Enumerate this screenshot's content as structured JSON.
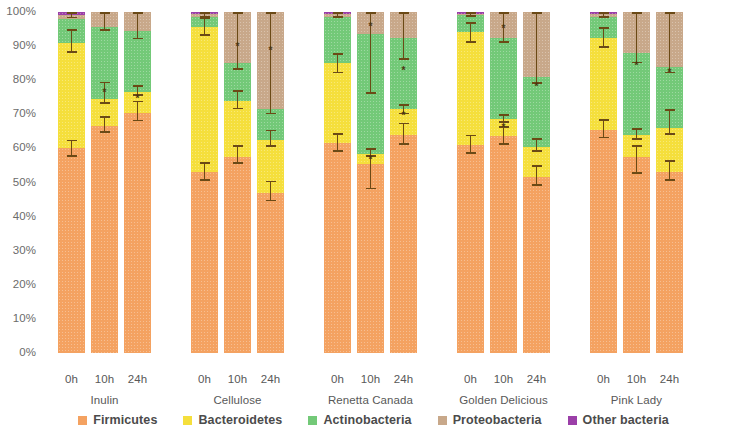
{
  "axis": {
    "y_ticks": [
      "100%",
      "90%",
      "80%",
      "70%",
      "60%",
      "50%",
      "40%",
      "30%",
      "20%",
      "10%",
      "0%"
    ],
    "y_min": 0,
    "y_max": 100
  },
  "legend": [
    {
      "label": "Firmicutes",
      "color": "#F4A261"
    },
    {
      "label": "Bacteroidetes",
      "color": "#F5DF3C"
    },
    {
      "label": "Actinobacteria",
      "color": "#73C978"
    },
    {
      "label": "Proteobacteria",
      "color": "#C8A88A"
    },
    {
      "label": "Other bacteria",
      "color": "#9B3FA8"
    }
  ],
  "groups": [
    {
      "name": "Inulin",
      "times": [
        "0h",
        "10h",
        "24h"
      ]
    },
    {
      "name": "Cellulose",
      "times": [
        "0h",
        "10h",
        "24h"
      ]
    },
    {
      "name": "Renetta Canada",
      "times": [
        "0h",
        "10h",
        "24h"
      ]
    },
    {
      "name": "Golden Delicious",
      "times": [
        "0h",
        "10h",
        "24h"
      ]
    },
    {
      "name": "Pink Lady",
      "times": [
        "0h",
        "10h",
        "24h"
      ]
    }
  ],
  "chart_data": {
    "type": "bar",
    "title": "",
    "xlabel": "",
    "ylabel": "",
    "ylim": [
      0,
      100
    ],
    "grid": false,
    "stacked": true,
    "legend_position": "bottom",
    "categories": [
      "Inulin 0h",
      "Inulin 10h",
      "Inulin 24h",
      "Cellulose 0h",
      "Cellulose 10h",
      "Cellulose 24h",
      "Renetta Canada 0h",
      "Renetta Canada 10h",
      "Renetta Canada 24h",
      "Golden Delicious 0h",
      "Golden Delicious 10h",
      "Golden Delicious 24h",
      "Pink Lady 0h",
      "Pink Lady 10h",
      "Pink Lady 24h"
    ],
    "series": [
      {
        "name": "Firmicutes",
        "color": "#F4A261",
        "values": [
          60.0,
          66.5,
          70.5,
          53.0,
          57.5,
          47.0,
          61.5,
          55.5,
          64.0,
          61.0,
          63.5,
          51.5,
          65.5,
          57.5,
          53.0
        ]
      },
      {
        "name": "Bacteroidetes",
        "color": "#F5DF3C",
        "values": [
          31.0,
          8.0,
          6.0,
          42.5,
          16.5,
          15.5,
          23.5,
          3.0,
          7.5,
          33.0,
          5.0,
          9.0,
          27.0,
          6.5,
          13.0
        ]
      },
      {
        "name": "Actinobacteria",
        "color": "#73C978",
        "values": [
          7.0,
          21.0,
          18.0,
          3.0,
          11.0,
          9.0,
          13.5,
          35.0,
          21.0,
          5.0,
          24.0,
          20.5,
          6.0,
          24.0,
          18.0
        ]
      },
      {
        "name": "Proteobacteria",
        "color": "#C8A88A",
        "values": [
          1.0,
          4.5,
          5.5,
          1.0,
          15.0,
          28.5,
          1.0,
          6.5,
          7.5,
          0.5,
          7.5,
          19.0,
          1.0,
          12.0,
          16.0
        ]
      },
      {
        "name": "Other bacteria",
        "color": "#9B3FA8",
        "values": [
          1.0,
          0.0,
          0.0,
          0.5,
          0.0,
          0.0,
          0.5,
          0.0,
          0.0,
          0.5,
          0.0,
          0.0,
          0.5,
          0.0,
          0.0
        ]
      }
    ],
    "error_bars": [
      {
        "bar": "Inulin 0h",
        "marks": [
          {
            "at": 60.0,
            "lo": 57.5,
            "hi": 62.5
          },
          {
            "at": 91.0,
            "lo": 88.0,
            "hi": 95.0
          },
          {
            "at": 99.0,
            "lo": 98.2,
            "hi": 100.0
          }
        ]
      },
      {
        "bar": "Inulin 10h",
        "marks": [
          {
            "at": 66.5,
            "lo": 64.5,
            "hi": 69.5
          },
          {
            "at": 74.5,
            "lo": 73.0,
            "hi": 79.5
          },
          {
            "at": 95.5,
            "lo": 94.5,
            "hi": 100.0
          }
        ]
      },
      {
        "bar": "Inulin 24h",
        "marks": [
          {
            "at": 70.5,
            "lo": 68.0,
            "hi": 74.0
          },
          {
            "at": 76.5,
            "lo": 75.5,
            "hi": 78.5
          },
          {
            "at": 94.5,
            "lo": 92.0,
            "hi": 100.0
          }
        ]
      },
      {
        "bar": "Cellulose 0h",
        "marks": [
          {
            "at": 53.0,
            "lo": 50.5,
            "hi": 56.0
          },
          {
            "at": 95.5,
            "lo": 93.0,
            "hi": 98.5
          },
          {
            "at": 99.0,
            "lo": 98.3,
            "hi": 100.0
          }
        ]
      },
      {
        "bar": "Cellulose 10h",
        "marks": [
          {
            "at": 57.5,
            "lo": 55.5,
            "hi": 61.0
          },
          {
            "at": 74.0,
            "lo": 71.5,
            "hi": 77.0
          },
          {
            "at": 85.0,
            "lo": 83.0,
            "hi": 100.0
          }
        ]
      },
      {
        "bar": "Cellulose 24h",
        "marks": [
          {
            "at": 47.0,
            "lo": 44.5,
            "hi": 50.5
          },
          {
            "at": 62.5,
            "lo": 60.5,
            "hi": 65.5
          },
          {
            "at": 71.5,
            "lo": 70.0,
            "hi": 100.0
          }
        ]
      },
      {
        "bar": "Renetta Canada 0h",
        "marks": [
          {
            "at": 61.5,
            "lo": 59.0,
            "hi": 64.5
          },
          {
            "at": 85.0,
            "lo": 82.0,
            "hi": 88.0
          },
          {
            "at": 99.0,
            "lo": 98.3,
            "hi": 100.0
          }
        ]
      },
      {
        "bar": "Renetta Canada 10h",
        "marks": [
          {
            "at": 55.5,
            "lo": 48.0,
            "hi": 60.0
          },
          {
            "at": 58.5,
            "lo": 57.5,
            "hi": 60.0
          },
          {
            "at": 93.5,
            "lo": 76.0,
            "hi": 100.0
          }
        ]
      },
      {
        "bar": "Renetta Canada 24h",
        "marks": [
          {
            "at": 64.0,
            "lo": 61.0,
            "hi": 67.5
          },
          {
            "at": 71.5,
            "lo": 70.0,
            "hi": 73.0
          },
          {
            "at": 92.5,
            "lo": 86.0,
            "hi": 100.0
          }
        ]
      },
      {
        "bar": "Golden Delicious 0h",
        "marks": [
          {
            "at": 61.0,
            "lo": 58.5,
            "hi": 64.0
          },
          {
            "at": 94.0,
            "lo": 91.0,
            "hi": 97.0
          },
          {
            "at": 99.5,
            "lo": 98.6,
            "hi": 100.0
          }
        ]
      },
      {
        "bar": "Golden Delicious 10h",
        "marks": [
          {
            "at": 63.5,
            "lo": 61.0,
            "hi": 66.5
          },
          {
            "at": 68.5,
            "lo": 67.5,
            "hi": 70.0
          },
          {
            "at": 92.5,
            "lo": 91.0,
            "hi": 100.0
          }
        ]
      },
      {
        "bar": "Golden Delicious 24h",
        "marks": [
          {
            "at": 51.5,
            "lo": 49.0,
            "hi": 55.0
          },
          {
            "at": 60.5,
            "lo": 59.0,
            "hi": 63.0
          },
          {
            "at": 81.0,
            "lo": 79.0,
            "hi": 100.0
          }
        ]
      },
      {
        "bar": "Pink Lady 0h",
        "marks": [
          {
            "at": 65.5,
            "lo": 63.0,
            "hi": 68.5
          },
          {
            "at": 92.5,
            "lo": 89.5,
            "hi": 95.5
          },
          {
            "at": 99.0,
            "lo": 98.3,
            "hi": 100.0
          }
        ]
      },
      {
        "bar": "Pink Lady 10h",
        "marks": [
          {
            "at": 57.5,
            "lo": 52.5,
            "hi": 61.0
          },
          {
            "at": 64.0,
            "lo": 62.5,
            "hi": 66.0
          },
          {
            "at": 88.0,
            "lo": 85.0,
            "hi": 100.0
          }
        ]
      },
      {
        "bar": "Pink Lady 24h",
        "marks": [
          {
            "at": 53.0,
            "lo": 50.5,
            "hi": 56.5
          },
          {
            "at": 66.0,
            "lo": 64.0,
            "hi": 71.5
          },
          {
            "at": 84.0,
            "lo": 82.0,
            "hi": 100.0
          }
        ]
      }
    ],
    "significance_markers": [
      {
        "bar": "Inulin 10h",
        "at": 77.0
      },
      {
        "bar": "Inulin 24h",
        "at": 75.5
      },
      {
        "bar": "Cellulose 10h",
        "at": 90.5
      },
      {
        "bar": "Cellulose 24h",
        "at": 89.5
      },
      {
        "bar": "Renetta Canada 10h",
        "at": 96.5
      },
      {
        "bar": "Renetta Canada 10h",
        "at": 57.5
      },
      {
        "bar": "Renetta Canada 24h",
        "at": 83.5
      },
      {
        "bar": "Renetta Canada 24h",
        "at": 70.5
      },
      {
        "bar": "Golden Delicious 10h",
        "at": 96.0
      },
      {
        "bar": "Golden Delicious 10h",
        "at": 67.0
      },
      {
        "bar": "Golden Delicious 24h",
        "at": 79.0
      },
      {
        "bar": "Pink Lady 10h",
        "at": 85.0
      },
      {
        "bar": "Pink Lady 24h",
        "at": 83.0
      }
    ]
  }
}
